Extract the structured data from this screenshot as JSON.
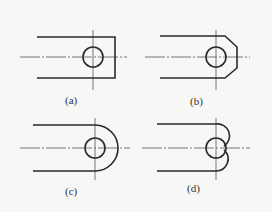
{
  "figure": {
    "panels": [
      {
        "id": "a",
        "label": "(a)",
        "end_shape": "square",
        "description": "Rectangular end with hole"
      },
      {
        "id": "b",
        "label": "(b)",
        "end_shape": "chamfered",
        "description": "Chamfered end with hole"
      },
      {
        "id": "c",
        "label": "(c)",
        "end_shape": "semicircle",
        "description": "Full round end with hole"
      },
      {
        "id": "d",
        "label": "(d)",
        "end_shape": "double-arc",
        "description": "Two small arcs tangent to hole"
      }
    ],
    "colors": {
      "background": "#f7f7f6",
      "line": "#2a2a2a",
      "centerline": "#555555"
    }
  }
}
